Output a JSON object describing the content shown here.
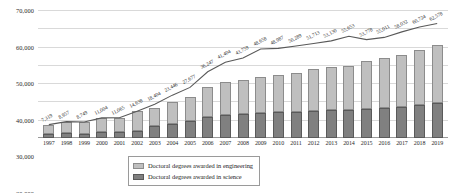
{
  "chart_data": {
    "type": "bar",
    "title": "",
    "subtitle": "",
    "xlabel": "",
    "ylabel": "",
    "ylim": [
      0,
      70000
    ],
    "yticks": [
      "10,000",
      "20,000",
      "30,000",
      "40,000",
      "50,000",
      "60,000",
      "70,000"
    ],
    "ytick_values": [
      10000,
      20000,
      30000,
      40000,
      50000,
      60000,
      70000
    ],
    "grid": true,
    "legend_position": "bottom-center",
    "categories": [
      "1997",
      "1998",
      "1999",
      "2000",
      "2001",
      "2002",
      "2003",
      "2004",
      "2005",
      "2006",
      "2007",
      "2008",
      "2009",
      "2010",
      "2011",
      "2012",
      "2013",
      "2014",
      "2015",
      "2016",
      "2017",
      "2018",
      "2019"
    ],
    "series": [
      {
        "name": "Doctoral degrees awarded in science",
        "type": "bar-segment",
        "color": "#808080",
        "values": [
          2100,
          2500,
          2450,
          3100,
          3150,
          4100,
          6600,
          7800,
          9500,
          11500,
          12800,
          13100,
          13600,
          14000,
          14400,
          14800,
          15200,
          15500,
          15900,
          16300,
          17000,
          18000,
          19200
        ]
      },
      {
        "name": "Doctoral degrees awarded in engineering",
        "type": "bar-segment",
        "color": "#bfbfbf",
        "values": [
          5219,
          6457,
          6299,
          7904,
          7915,
          10538,
          9846,
          11877,
          13177,
          16147,
          17604,
          18887,
          19689,
          20713,
          21130,
          22853,
          23578,
          24011,
          26032,
          27724,
          28378,
          30000,
          31800
        ]
      },
      {
        "name": "Total doctoral degrees awarded",
        "type": "line",
        "color": "#595959",
        "labels": [
          "7,319",
          "8,957",
          "8,749",
          "11,004",
          "11,065",
          "14,638",
          "16,446",
          "19,677",
          "22,677",
          "27,647",
          "30,404",
          "31,987",
          "33,289",
          "34,713",
          "35,530",
          "37,653",
          "38,778",
          "39,511",
          "41,932",
          "44,024",
          "45,378",
          "48,000",
          "51,000"
        ],
        "values": [
          7319,
          8957,
          8749,
          11004,
          11065,
          14638,
          16446,
          19677,
          22677,
          27647,
          30404,
          31987,
          33289,
          34713,
          35530,
          37653,
          38778,
          39511,
          41932,
          44024,
          45378,
          48000,
          51000
        ],
        "display_labels": [
          "7,319",
          "8,957",
          "8,749",
          "11,004",
          "11,065",
          "14,638",
          "18,404",
          "23,446",
          "27,677",
          "36,247",
          "41,404",
          "43,759",
          "48,658",
          "48,987",
          "50,289",
          "51,713",
          "53,130",
          "55,653",
          "53,778",
          "55,011",
          "58,032",
          "60,724",
          "62,578"
        ],
        "display_values": [
          7319,
          8957,
          8749,
          11004,
          11065,
          14638,
          18404,
          23446,
          27677,
          36247,
          41404,
          43759,
          48658,
          48987,
          50289,
          51713,
          53130,
          55653,
          53778,
          55011,
          58032,
          60724,
          62578
        ]
      }
    ]
  },
  "legend": {
    "items": [
      {
        "label": "Doctoral degrees awarded in engineering",
        "color": "#bfbfbf"
      },
      {
        "label": "Doctoral degrees awarded in science",
        "color": "#808080"
      }
    ]
  }
}
